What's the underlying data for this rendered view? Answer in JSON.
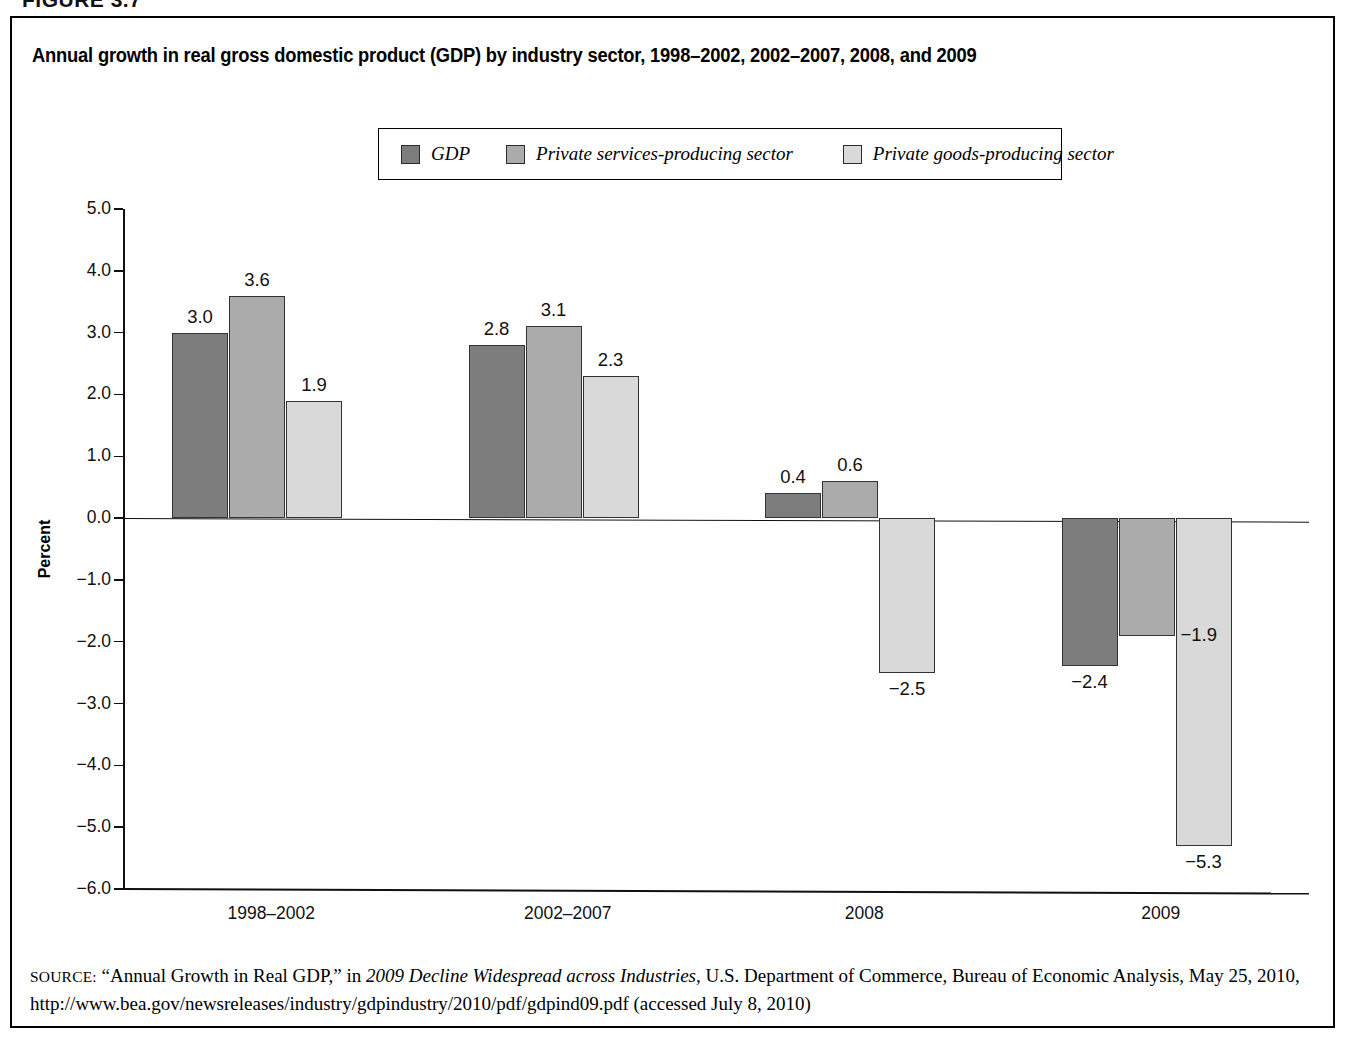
{
  "figure_caption": "FIGURE 3.7",
  "chart_title": "Annual growth in real gross domestic product (GDP) by industry sector, 1998–2002, 2002–2007, 2008, and 2009",
  "y_axis_title": "Percent",
  "legend": [
    {
      "label": "GDP",
      "color": "#7d7d7d"
    },
    {
      "label": "Private services-producing sector",
      "color": "#ababab"
    },
    {
      "label": "Private goods-producing sector",
      "color": "#d9d9d9"
    }
  ],
  "source": {
    "label": "SOURCE:",
    "text": " “Annual Growth in Real GDP,” in ",
    "italic_title": "2009 Decline Widespread across Industries",
    "text_after": ", U.S. Department of Commerce, Bureau of Economic Analysis, May 25, 2010, http://www.bea.gov/newsreleases/industry/gdpindustry/2010/pdf/gdpind09.pdf (accessed July 8, 2010)"
  },
  "chart_data": {
    "type": "bar",
    "title": "Annual growth in real gross domestic product (GDP) by industry sector, 1998–2002, 2002–2007, 2008, and 2009",
    "xlabel": "",
    "ylabel": "Percent",
    "ylim": [
      -6.0,
      5.0
    ],
    "ytick_labels": [
      "5.0",
      "4.0",
      "3.0",
      "2.0",
      "1.0",
      "0.0",
      "−1.0",
      "−2.0",
      "−3.0",
      "−4.0",
      "−5.0",
      "−6.0"
    ],
    "ytick_values": [
      5.0,
      4.0,
      3.0,
      2.0,
      1.0,
      0.0,
      -1.0,
      -2.0,
      -3.0,
      -4.0,
      -5.0,
      -6.0
    ],
    "grid": false,
    "legend_position": "top-center",
    "categories": [
      "1998–2002",
      "2002–2007",
      "2008",
      "2009"
    ],
    "series": [
      {
        "name": "GDP",
        "color": "#7d7d7d",
        "values": [
          3.0,
          2.8,
          0.4,
          -2.4
        ],
        "labels": [
          "3.0",
          "2.8",
          "0.4",
          "−2.4"
        ]
      },
      {
        "name": "Private services-producing sector",
        "color": "#ababab",
        "values": [
          3.6,
          3.1,
          0.6,
          -1.9
        ],
        "labels": [
          "3.6",
          "3.1",
          "0.6",
          "−1.9"
        ]
      },
      {
        "name": "Private goods-producing sector",
        "color": "#d9d9d9",
        "values": [
          1.9,
          2.3,
          -2.5,
          -5.3
        ],
        "labels": [
          "1.9",
          "2.3",
          "−2.5",
          "−5.3"
        ]
      }
    ]
  }
}
